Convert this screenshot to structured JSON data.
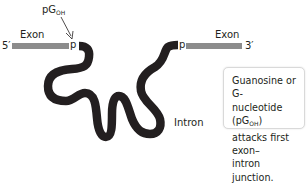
{
  "diagram": {
    "colors": {
      "exon": "#8c8c8c",
      "intron": "#231f20",
      "text": "#231f20",
      "callout_border": "#d9d9d9"
    },
    "left_exon": {
      "label": "Exon",
      "end_label": "5′",
      "junction_label": "p"
    },
    "right_exon": {
      "label": "Exon",
      "end_label": "3′",
      "junction_label": "p"
    },
    "intron": {
      "label": "Intron"
    },
    "nucleophile": {
      "label_main": "pG",
      "label_sub": "OH",
      "arrow": "arrow-to-left-junction"
    },
    "callout": {
      "line1": "Guanosine or G-",
      "line2_pre": "nucleotide (pG",
      "line2_sub": "OH",
      "line2_post": ")",
      "line3": "attacks first exon–",
      "line4": "intron junction."
    }
  }
}
